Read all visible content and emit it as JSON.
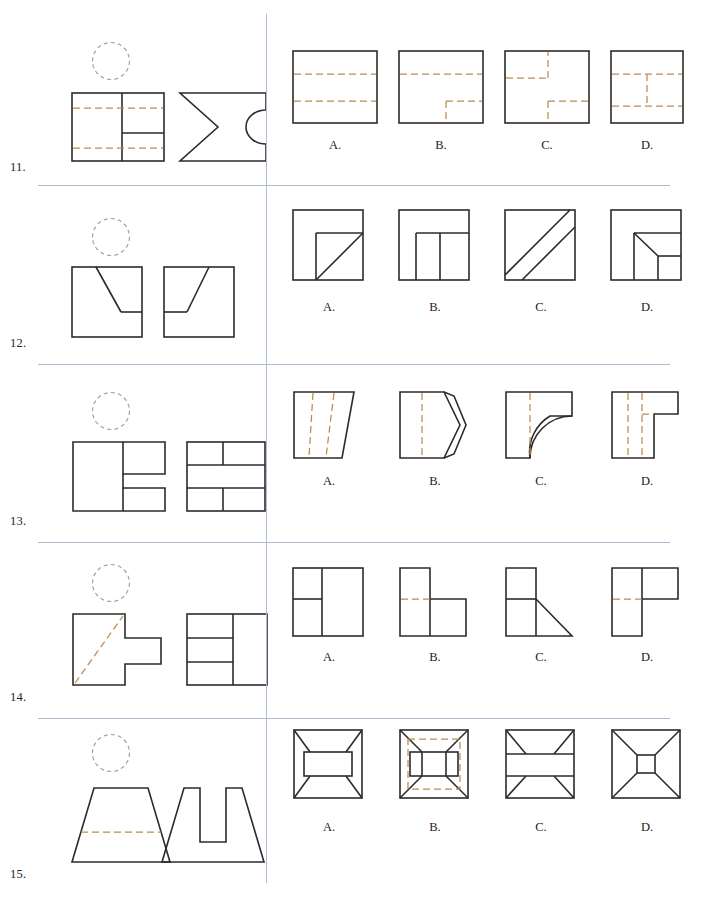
{
  "page": {
    "width": 707,
    "height": 903,
    "background": "#ffffff"
  },
  "styles": {
    "solid_stroke": "#2b2b2b",
    "hidden_stroke": "#b98b53",
    "circle_stroke": "#9aa89a",
    "rule_color": "#aebdd2"
  },
  "option_labels": [
    "A.",
    "B.",
    "C.",
    "D."
  ],
  "problems": [
    {
      "number": "11.",
      "missing_view_marker": "dashed-circle",
      "given_views": [
        {
          "name": "front-view",
          "description": "square with vertical divider, interior horizontal segment, two full-width hidden lines"
        },
        {
          "name": "side-view",
          "description": "square with V-notch cut on left edge and semicircular arc cut on right edge"
        }
      ],
      "options": [
        {
          "label": "A.",
          "description": "square with two full-width horizontal hidden lines"
        },
        {
          "label": "B.",
          "description": "square with upper horizontal hidden line and lower stepped hidden line to bottom edge"
        },
        {
          "label": "C.",
          "description": "square with two stepped hidden lines forming offset notches"
        },
        {
          "label": "D.",
          "description": "square with two horizontal hidden lines joined by central vertical hidden line"
        }
      ]
    },
    {
      "number": "12.",
      "missing_view_marker": "dashed-circle",
      "given_views": [
        {
          "name": "front-view",
          "description": "square with diagonal descending from top to a horizontal ledge at right"
        },
        {
          "name": "side-view",
          "description": "square with diagonal ascending from a left ledge to top right corner"
        }
      ],
      "options": [
        {
          "label": "A.",
          "description": "square with inner rectangle top-left region and diagonal across lower-right block"
        },
        {
          "label": "B.",
          "description": "square with horizontal band and two vertical dividers forming lower cells"
        },
        {
          "label": "C.",
          "description": "square crossed by two parallel diagonals corner to corner"
        },
        {
          "label": "D.",
          "description": "square with inner stepped block and short diagonal at lower-left of block"
        }
      ]
    },
    {
      "number": "13.",
      "missing_view_marker": "dashed-circle",
      "given_views": [
        {
          "name": "front-view",
          "description": "C-shaped outline with notch opening to the right"
        },
        {
          "name": "top-view",
          "description": "rectangle divided into staggered brick-like cells"
        }
      ],
      "options": [
        {
          "label": "A.",
          "description": "trapezoid slanting right with two vertical hidden lines"
        },
        {
          "label": "B.",
          "description": "rectangle with chevron-shaped right edge and vertical hidden line"
        },
        {
          "label": "C.",
          "description": "square with quarter-round arc cut at lower right and vertical hidden line"
        },
        {
          "label": "D.",
          "description": "L-shaped outline with vertical hidden lines and stepped hidden corner"
        }
      ]
    },
    {
      "number": "14.",
      "missing_view_marker": "dashed-circle",
      "given_views": [
        {
          "name": "front-view",
          "description": "sideways T-shape with diagonal hidden line across the tall block"
        },
        {
          "name": "top-view",
          "description": "rectangle split into a tall right cell and three stacked left cells"
        }
      ],
      "options": [
        {
          "label": "A.",
          "description": "rectangle with vertical divider and horizontal divider on left half"
        },
        {
          "label": "B.",
          "description": "L-shape with tall left block, low right block, horizontal hidden line"
        },
        {
          "label": "C.",
          "description": "L-shape with tall left block and triangular diagonal at lower right"
        },
        {
          "label": "D.",
          "description": "L-shape with tall left block, upper right block, horizontal hidden line"
        }
      ]
    },
    {
      "number": "15.",
      "missing_view_marker": "dashed-circle",
      "given_views": [
        {
          "name": "front-view",
          "description": "trapezoid with horizontal hidden line across lower portion"
        },
        {
          "name": "side-view",
          "description": "trapezoid with deep rectangular slot cut down from top center"
        }
      ],
      "options": [
        {
          "label": "A.",
          "description": "square with corner diagonals meeting a wide central rectangle"
        },
        {
          "label": "B.",
          "description": "square with corner diagonals, central rectangle, and dashed inner square"
        },
        {
          "label": "C.",
          "description": "square with two horizontal bands and corner diagonals at top and bottom"
        },
        {
          "label": "D.",
          "description": "square with corner diagonals converging to a small central square"
        }
      ]
    }
  ]
}
